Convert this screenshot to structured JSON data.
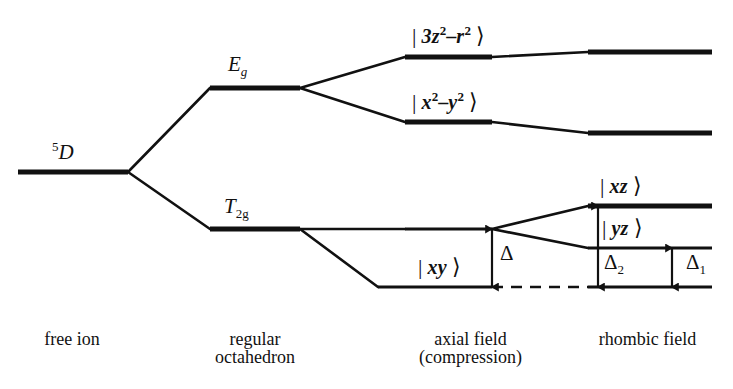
{
  "figure": {
    "type": "energy-level-splitting-diagram",
    "background_color": "#ffffff",
    "line_color": "#111111"
  },
  "columns": [
    {
      "id": "free-ion",
      "caption_line1": "free ion",
      "caption_line2": "",
      "center_x": 72
    },
    {
      "id": "regular-octahedron",
      "caption_line1": "regular",
      "caption_line2": "octahedron",
      "center_x": 255
    },
    {
      "id": "axial-field",
      "caption_line1": "axial field",
      "caption_line2": "(compression)",
      "center_x": 470
    },
    {
      "id": "rhombic-field",
      "caption_line1": "rhombic field",
      "caption_line2": "",
      "center_x": 645
    }
  ],
  "levels": [
    {
      "id": "free-ion-5D",
      "column": "free-ion",
      "label": "5D",
      "label_pre_superscript": "5",
      "label_text": "D",
      "x1": 18,
      "x2": 128,
      "y": 172,
      "weight": "thick"
    },
    {
      "id": "oct-Eg",
      "column": "regular-octahedron",
      "label": "Eg",
      "label_text": "E",
      "label_subscript": "g",
      "x1": 210,
      "x2": 300,
      "y": 88,
      "weight": "thick"
    },
    {
      "id": "oct-T2g",
      "column": "regular-octahedron",
      "label": "T2g",
      "label_text": "T",
      "label_subscript": "2g",
      "x1": 210,
      "x2": 300,
      "y": 229,
      "weight": "thick"
    },
    {
      "id": "axial-3z2-r2",
      "column": "axial-field",
      "label": "|3z2-r2>",
      "x1": 405,
      "x2": 492,
      "y": 57,
      "weight": "thick"
    },
    {
      "id": "axial-x2-y2",
      "column": "axial-field",
      "label": "|x2-y2>",
      "x1": 405,
      "x2": 492,
      "y": 122,
      "weight": "thick"
    },
    {
      "id": "axial-t2g",
      "column": "axial-field",
      "label": "",
      "x1": 405,
      "x2": 492,
      "y": 229,
      "weight": "medium"
    },
    {
      "id": "axial-xy",
      "column": "axial-field",
      "label": "|xy>",
      "x1": 378,
      "x2": 492,
      "y": 287,
      "weight": "medium"
    },
    {
      "id": "rhombic-upper-1",
      "column": "rhombic-field",
      "label": "",
      "x1": 588,
      "x2": 712,
      "y": 52,
      "weight": "thick"
    },
    {
      "id": "rhombic-upper-2",
      "column": "rhombic-field",
      "label": "",
      "x1": 588,
      "x2": 712,
      "y": 133,
      "weight": "thick"
    },
    {
      "id": "rhombic-xz",
      "column": "rhombic-field",
      "label": "|xz>",
      "x1": 588,
      "x2": 712,
      "y": 206,
      "weight": "thick"
    },
    {
      "id": "rhombic-yz",
      "column": "rhombic-field",
      "label": "|yz>",
      "x1": 588,
      "x2": 712,
      "y": 248,
      "weight": "medium"
    },
    {
      "id": "rhombic-ground",
      "column": "rhombic-field",
      "label": "",
      "x1": 588,
      "x2": 712,
      "y": 287,
      "weight": "medium"
    }
  ],
  "ket_labels": [
    {
      "id": "ket-3z2-r2",
      "orbital": "3z",
      "exp1": "2",
      "minus": "–",
      "orbital2": "r",
      "exp2": "2",
      "x": 412,
      "y": 24
    },
    {
      "id": "ket-x2-y2",
      "orbital": "x",
      "exp1": "2",
      "minus": "–",
      "orbital2": "y",
      "exp2": "2",
      "x": 412,
      "y": 90
    },
    {
      "id": "ket-xy",
      "orbital": "xy",
      "exp1": "",
      "minus": "",
      "orbital2": "",
      "exp2": "",
      "x": 418,
      "y": 256
    },
    {
      "id": "ket-xz",
      "orbital": "xz",
      "exp1": "",
      "minus": "",
      "orbital2": "",
      "exp2": "",
      "x": 600,
      "y": 175
    },
    {
      "id": "ket-yz",
      "orbital": "yz",
      "exp1": "",
      "minus": "",
      "orbital2": "",
      "exp2": "",
      "x": 602,
      "y": 217
    }
  ],
  "connectors": [
    {
      "id": "free-to-Eg",
      "points": "128,172 210,88"
    },
    {
      "id": "free-to-T2g",
      "points": "128,172 210,229"
    },
    {
      "id": "Eg-to-3z2",
      "points": "300,88 405,57"
    },
    {
      "id": "Eg-to-x2y2",
      "points": "300,88 405,122"
    },
    {
      "id": "T2g-to-axial-t2g",
      "points": "300,229 405,229"
    },
    {
      "id": "T2g-to-axial-xy",
      "points": "300,229 378,287"
    },
    {
      "id": "3z2-to-rhombic1",
      "points": "492,57 588,52"
    },
    {
      "id": "x2y2-to-rhombic2",
      "points": "492,122 588,133"
    },
    {
      "id": "axial-t2g-to-xz",
      "points": "492,229 588,206"
    },
    {
      "id": "axial-t2g-to-yz",
      "points": "492,229 588,248"
    }
  ],
  "dashed_connectors": [
    {
      "id": "xy-baseline-extension",
      "x1": 492,
      "x2": 588,
      "y": 287
    }
  ],
  "measure_arrows": [
    {
      "id": "delta-arrow",
      "label": "Δ",
      "subscript": "",
      "x": 492,
      "y_top": 229,
      "y_bottom": 287,
      "label_x": 500,
      "label_y": 243
    },
    {
      "id": "delta2-arrow",
      "label": "Δ",
      "subscript": "2",
      "x": 598,
      "y_top": 206,
      "y_bottom": 287,
      "label_x": 604,
      "label_y": 252
    },
    {
      "id": "delta1-arrow",
      "label": "Δ",
      "subscript": "1",
      "x": 672,
      "y_top": 248,
      "y_bottom": 287,
      "label_x": 686,
      "label_y": 252
    }
  ],
  "captions": {
    "free_ion": {
      "line1": "free ion",
      "line2": ""
    },
    "regular_octahedron": {
      "line1": "regular",
      "line2": "octahedron"
    },
    "axial_field": {
      "line1": "axial field",
      "line2": "(compression)"
    },
    "rhombic_field": {
      "line1": "rhombic field",
      "line2": ""
    }
  },
  "term_labels": {
    "free_ion": {
      "superscript": "5",
      "text": "D",
      "x": 52,
      "y": 140
    },
    "eg": {
      "text": "E",
      "subscript": "g",
      "x": 228,
      "y": 54
    },
    "t2g": {
      "text": "T",
      "subscript": "2g",
      "x": 224,
      "y": 196
    }
  }
}
